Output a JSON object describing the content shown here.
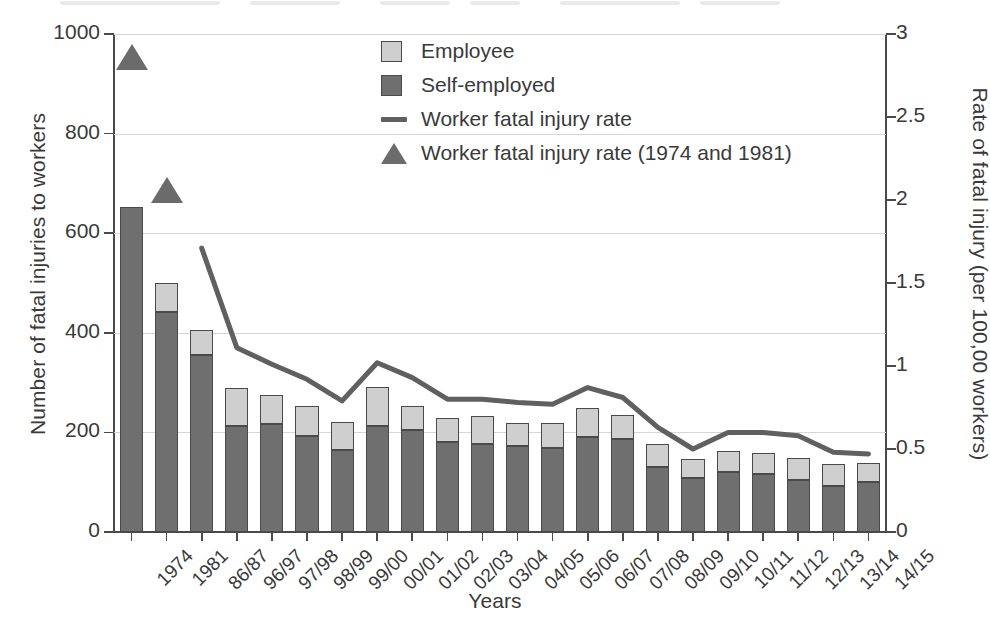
{
  "chart_data": {
    "type": "bar",
    "title": "",
    "xlabel": "Years",
    "ylabel": "Number of fatal injuries to workers",
    "ylabel_right": "Rate of fatal injury (per 100,00 workers)",
    "ylim": [
      0,
      1000
    ],
    "ylim_right": [
      0,
      3
    ],
    "yticks": [
      "0",
      "200",
      "400",
      "600",
      "800",
      "1000"
    ],
    "ytick_values": [
      0,
      200,
      400,
      600,
      800,
      1000
    ],
    "yticks_right": [
      "0",
      "0.5",
      "1",
      "1.5",
      "2",
      "2.5",
      "3"
    ],
    "ytick_values_right": [
      0,
      0.5,
      1,
      1.5,
      2,
      2.5,
      3
    ],
    "grid": true,
    "legend_position": "upper center",
    "categories": [
      "1974",
      "1981",
      "86/87",
      "96/97",
      "97/98",
      "98/99",
      "99/00",
      "00/01",
      "01/02",
      "02/03",
      "03/04",
      "04/05",
      "05/06",
      "06/07",
      "07/08",
      "08/09",
      "09/10",
      "10/11",
      "11/12",
      "12/13",
      "13/14",
      "14/15"
    ],
    "series": [
      {
        "name": "Self-employed",
        "type": "bar-segment",
        "color": "#6f6f6f",
        "values": [
          653,
          441,
          355,
          213,
          216,
          192,
          165,
          213,
          204,
          180,
          176,
          173,
          168,
          190,
          186,
          130,
          108,
          120,
          117,
          104,
          93,
          101
        ]
      },
      {
        "name": "Employee",
        "type": "bar-segment",
        "color": "#cfcfcf",
        "values": [
          0,
          60,
          50,
          76,
          59,
          62,
          55,
          78,
          50,
          48,
          57,
          46,
          50,
          59,
          48,
          47,
          39,
          42,
          42,
          44,
          43,
          38
        ]
      },
      {
        "name": "Total fatal injuries",
        "type": "bar-total",
        "values": [
          653,
          501,
          405,
          289,
          275,
          254,
          220,
          291,
          254,
          228,
          233,
          219,
          218,
          249,
          234,
          177,
          147,
          162,
          159,
          148,
          136,
          139
        ]
      },
      {
        "name": "Worker fatal injury rate",
        "type": "line",
        "color": "#606060",
        "axis": "right",
        "values": [
          null,
          null,
          1.71,
          1.11,
          1.01,
          0.92,
          0.79,
          1.02,
          0.93,
          0.8,
          0.8,
          0.78,
          0.77,
          0.87,
          0.81,
          0.63,
          0.5,
          0.6,
          0.6,
          0.58,
          0.48,
          0.47
        ]
      },
      {
        "name": "Worker fatal injury rate (1974 and 1981)",
        "type": "marker-triangle",
        "color": "#6b6b6b",
        "axis": "right",
        "values": [
          2.86,
          2.06,
          null,
          null,
          null,
          null,
          null,
          null,
          null,
          null,
          null,
          null,
          null,
          null,
          null,
          null,
          null,
          null,
          null,
          null,
          null,
          null
        ]
      }
    ]
  },
  "legend": {
    "items": [
      {
        "label": "Employee",
        "marker": "square-light-icon"
      },
      {
        "label": "Self-employed",
        "marker": "square-dark-icon"
      },
      {
        "label": "Worker fatal injury rate",
        "marker": "line-icon"
      },
      {
        "label": "Worker fatal injury rate (1974 and 1981)",
        "marker": "triangle-icon"
      }
    ]
  },
  "colors": {
    "employee": "#cfcfcf",
    "self_employed": "#6f6f6f",
    "line": "#606060",
    "triangle": "#6b6b6b",
    "grid": "#d6d6d6",
    "axis": "#4a4a4a",
    "text": "#3a3a3a"
  }
}
